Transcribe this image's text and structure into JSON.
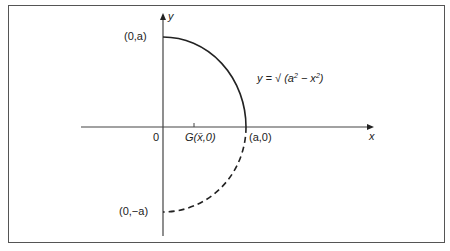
{
  "diagram": {
    "axes": {
      "x_label": "x",
      "y_label": "y",
      "origin_label": "0"
    },
    "points": {
      "top": "(0,a)",
      "bottom": "(0,−a)",
      "right": "(a,0)",
      "centroid": "G(x̄,0)"
    },
    "curve": {
      "equation_prefix": "y = √ (a",
      "equation_mid": " − x",
      "equation_suffix": ")",
      "exponent": "2",
      "solid_part": "upper quarter circle",
      "dashed_part": "lower quarter circle"
    },
    "colors": {
      "line": "#222222",
      "axis": "#444444",
      "frame": "#555555"
    }
  }
}
